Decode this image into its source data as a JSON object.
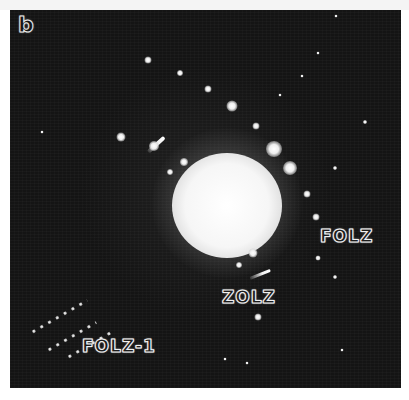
{
  "figure": {
    "panel_label": "b",
    "annotations": {
      "folz": "FOLZ",
      "zolz": "ZOLZ",
      "folz_minus_1": "FOLZ-1"
    },
    "colors": {
      "background": "#141414",
      "spot": "#ffffff",
      "label_outline": "#f2f2f2"
    }
  }
}
